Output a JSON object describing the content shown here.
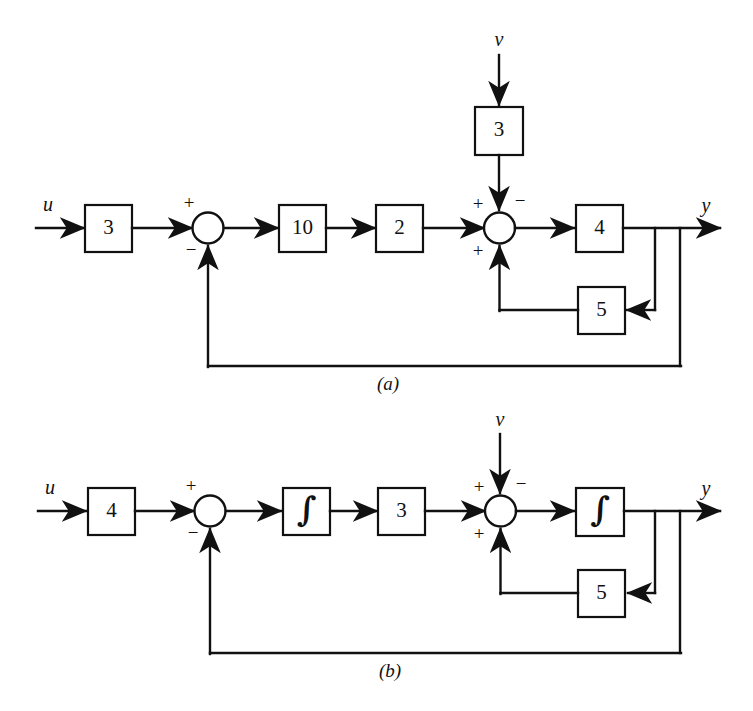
{
  "figure": {
    "background_color": "#ffffff",
    "line_color": "#111111",
    "type": "block-diagram"
  },
  "diagrams": [
    {
      "id": "a",
      "caption": "(a)",
      "input_label": "u",
      "disturbance_label": "v",
      "output_label": "y",
      "blocks": [
        {
          "name": "input-gain",
          "label": "3"
        },
        {
          "name": "forward-gain-1",
          "label": "10"
        },
        {
          "name": "forward-gain-2",
          "label": "2"
        },
        {
          "name": "disturbance-gain",
          "label": "3"
        },
        {
          "name": "plant-gain",
          "label": "4"
        },
        {
          "name": "inner-feedback-gain",
          "label": "5"
        }
      ],
      "summing_junctions": [
        {
          "name": "outer-summing-junction",
          "signs": {
            "input": "+",
            "feedback": "−"
          }
        },
        {
          "name": "inner-summing-junction",
          "signs": {
            "input": "+",
            "disturbance": "−",
            "feedback": "+"
          }
        }
      ]
    },
    {
      "id": "b",
      "caption": "(b)",
      "input_label": "u",
      "disturbance_label": "v",
      "output_label": "y",
      "blocks": [
        {
          "name": "input-gain",
          "label": "4"
        },
        {
          "name": "forward-integrator-1",
          "label": "∫"
        },
        {
          "name": "forward-gain-1",
          "label": "3"
        },
        {
          "name": "plant-integrator",
          "label": "∫"
        },
        {
          "name": "inner-feedback-gain",
          "label": "5"
        }
      ],
      "summing_junctions": [
        {
          "name": "outer-summing-junction",
          "signs": {
            "input": "+",
            "feedback": "−"
          }
        },
        {
          "name": "inner-summing-junction",
          "signs": {
            "input": "+",
            "disturbance": "−",
            "feedback": "+"
          }
        }
      ]
    }
  ]
}
